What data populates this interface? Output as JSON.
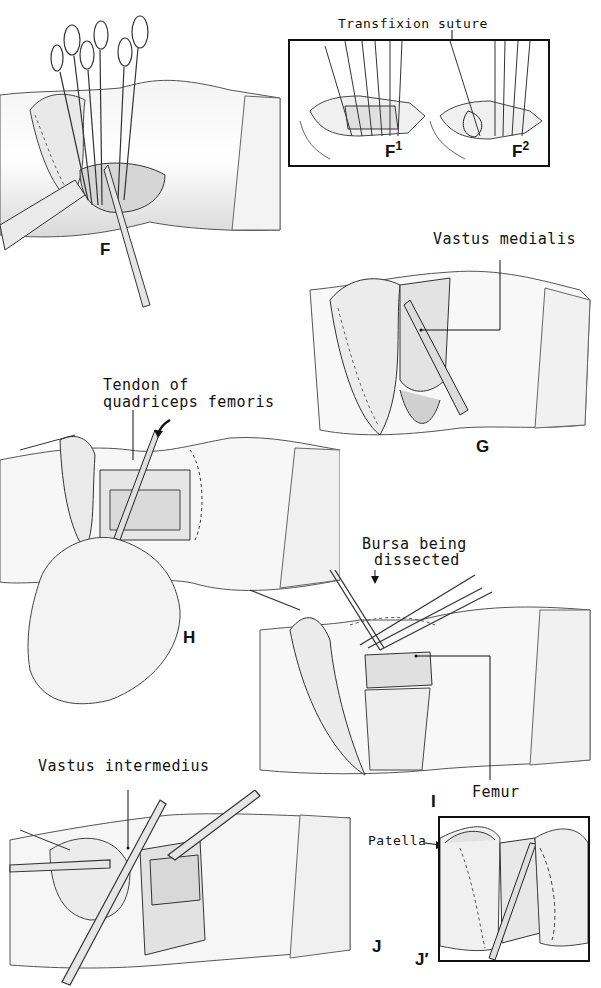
{
  "figure": {
    "type": "surgical-illustration",
    "background": "#ffffff",
    "ink_color": "#111111",
    "panels": [
      {
        "id": "F",
        "label": "F",
        "annotations": []
      },
      {
        "id": "F1",
        "label": "F",
        "superscript": "1",
        "annotations": []
      },
      {
        "id": "F2",
        "label": "F",
        "superscript": "2",
        "annotations": []
      },
      {
        "id": "G",
        "label": "G",
        "annotations": [
          "Vastus medialis"
        ]
      },
      {
        "id": "H",
        "label": "H",
        "annotations": [
          "Tendon of",
          "quadriceps femoris"
        ]
      },
      {
        "id": "I",
        "label": "I",
        "annotations": [
          "Bursa being",
          "dissected",
          "Femur"
        ]
      },
      {
        "id": "J",
        "label": "J",
        "annotations": [
          "Vastus intermedius"
        ]
      },
      {
        "id": "J'",
        "label": "J′",
        "annotations": [
          "Patella"
        ]
      }
    ]
  },
  "labels": {
    "transfixion": "Transfixion suture",
    "vastus_medialis": "Vastus medialis",
    "tendon_line1": "Tendon of",
    "tendon_line2": "quadriceps femoris",
    "bursa_line1": "Bursa being",
    "bursa_line2": "dissected",
    "femur": "Femur",
    "vastus_intermedius": "Vastus intermedius",
    "patella": "Patella"
  },
  "panel_ids": {
    "F": "F",
    "F1": "F",
    "F1_sup": "1",
    "F2": "F",
    "F2_sup": "2",
    "G": "G",
    "H": "H",
    "I": "I",
    "J": "J",
    "Jprime": "J′"
  }
}
